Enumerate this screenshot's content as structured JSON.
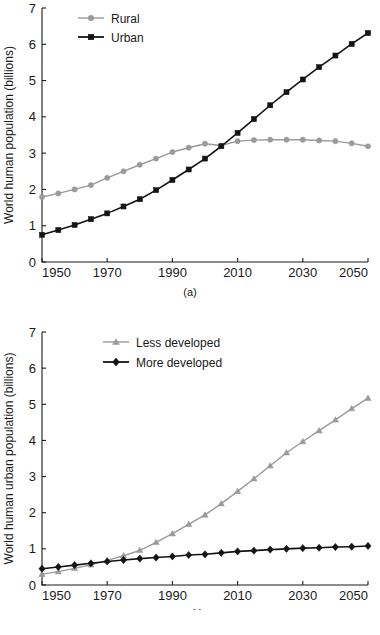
{
  "figure": {
    "panels": [
      {
        "id": "a",
        "caption": "(a)"
      },
      {
        "id": "b",
        "caption": "(b)"
      }
    ]
  },
  "chart_data": [
    {
      "type": "line",
      "panel": "a",
      "title": "",
      "xlabel": "Year",
      "ylabel": "World human population (billions)",
      "xlim": [
        1950,
        2050
      ],
      "ylim": [
        0,
        7
      ],
      "xticks": [
        1950,
        1970,
        1990,
        2010,
        2030,
        2050
      ],
      "xtick_labels": [
        "1950",
        "1970",
        "1990",
        "2010",
        "2030",
        "2050"
      ],
      "yticks": [
        0,
        1,
        2,
        3,
        4,
        5,
        6,
        7
      ],
      "ytick_labels": [
        "0",
        "1",
        "2",
        "3",
        "4",
        "5",
        "6",
        "7"
      ],
      "grid": false,
      "legend_position": "top-left",
      "x": [
        1950,
        1955,
        1960,
        1965,
        1970,
        1975,
        1980,
        1985,
        1990,
        1995,
        2000,
        2005,
        2010,
        2015,
        2020,
        2025,
        2030,
        2035,
        2040,
        2045,
        2050
      ],
      "series": [
        {
          "name": "Rural",
          "color": "#9a9a9a",
          "marker": "circle",
          "values": [
            1.79,
            1.89,
            2.0,
            2.12,
            2.32,
            2.5,
            2.68,
            2.85,
            3.03,
            3.15,
            3.26,
            3.21,
            3.33,
            3.36,
            3.37,
            3.37,
            3.37,
            3.35,
            3.33,
            3.27,
            3.19
          ]
        },
        {
          "name": "Urban",
          "color": "#141414",
          "marker": "square",
          "values": [
            0.75,
            0.88,
            1.02,
            1.18,
            1.34,
            1.53,
            1.73,
            1.98,
            2.26,
            2.55,
            2.85,
            3.19,
            3.56,
            3.94,
            4.32,
            4.68,
            5.03,
            5.37,
            5.69,
            6.01,
            6.31
          ]
        }
      ]
    },
    {
      "type": "line",
      "panel": "b",
      "title": "",
      "xlabel": "Year",
      "ylabel": "World human urban population (billions)",
      "xlim": [
        1950,
        2050
      ],
      "ylim": [
        0,
        7
      ],
      "xticks": [
        1950,
        1970,
        1990,
        2010,
        2030,
        2050
      ],
      "xtick_labels": [
        "1950",
        "1970",
        "1990",
        "2010",
        "2030",
        "2050"
      ],
      "yticks": [
        0,
        1,
        2,
        3,
        4,
        5,
        6,
        7
      ],
      "ytick_labels": [
        "0",
        "1",
        "2",
        "3",
        "4",
        "5",
        "6",
        "7"
      ],
      "grid": false,
      "legend_position": "top-left",
      "x": [
        1950,
        1955,
        1960,
        1965,
        1970,
        1975,
        1980,
        1985,
        1990,
        1995,
        2000,
        2005,
        2010,
        2015,
        2020,
        2025,
        2030,
        2035,
        2040,
        2045,
        2050
      ],
      "series": [
        {
          "name": "Less developed",
          "color": "#9a9a9a",
          "marker": "triangle",
          "values": [
            0.3,
            0.37,
            0.46,
            0.56,
            0.68,
            0.81,
            0.96,
            1.18,
            1.42,
            1.68,
            1.94,
            2.25,
            2.59,
            2.94,
            3.3,
            3.66,
            3.97,
            4.27,
            4.57,
            4.88,
            5.17
          ]
        },
        {
          "name": "More developed",
          "color": "#141414",
          "marker": "diamond",
          "values": [
            0.45,
            0.5,
            0.55,
            0.6,
            0.65,
            0.69,
            0.73,
            0.76,
            0.79,
            0.83,
            0.85,
            0.89,
            0.93,
            0.95,
            0.98,
            1.0,
            1.02,
            1.03,
            1.05,
            1.06,
            1.08
          ]
        }
      ]
    }
  ]
}
